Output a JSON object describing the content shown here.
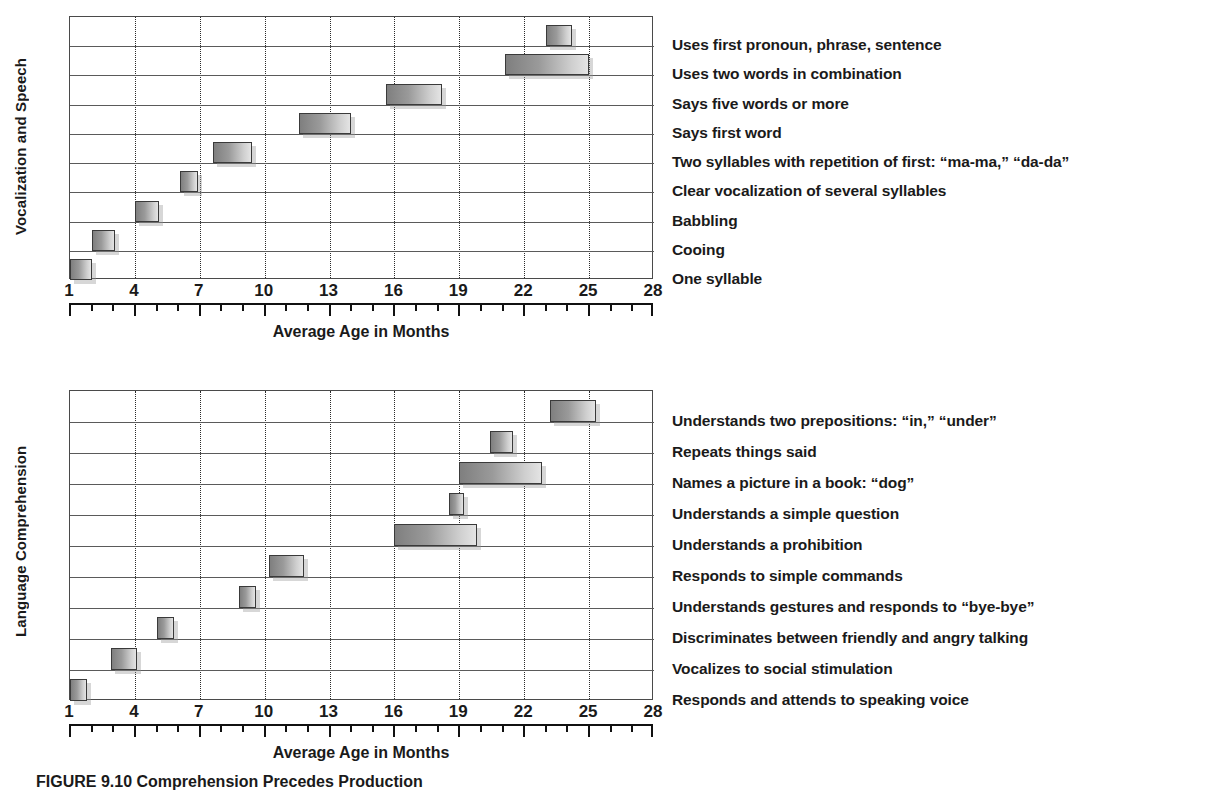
{
  "caption": "FIGURE 9.10  Comprehension Precedes Production",
  "axis": {
    "x_title": "Average Age in Months",
    "tick_labels": [
      "1",
      "4",
      "7",
      "10",
      "13",
      "16",
      "19",
      "22",
      "25",
      "28"
    ],
    "tick_values": [
      1,
      4,
      7,
      10,
      13,
      16,
      19,
      22,
      25,
      28
    ],
    "xlim": [
      1,
      28
    ]
  },
  "panels": [
    {
      "y_title": "Vocalization and Speech",
      "x_title": "Average Age in Months"
    },
    {
      "y_title": "Language Comprehension",
      "x_title": "Average Age in Months"
    }
  ],
  "chart_data": [
    {
      "type": "bar",
      "orientation": "horizontal",
      "title": "Vocalization and Speech",
      "subtitle": "",
      "xlabel": "Average Age in Months",
      "ylabel": "Vocalization and Speech",
      "xlim": [
        1,
        28
      ],
      "xticks": [
        1,
        4,
        7,
        10,
        13,
        16,
        19,
        22,
        25,
        28
      ],
      "grid": "vertical dotted gridlines at each major tick",
      "legend": "none",
      "note": "Each bar is a range (start-to-end age in months) drawn as a floating horizontal bar; rows are listed bottom-to-top in order of increasing age.",
      "categories": [
        "One syllable",
        "Cooing",
        "Babbling",
        "Clear vocalization of several syllables",
        "Two syllables with repetition of first: “ma-ma,” “da-da”",
        "Says first word",
        "Says five words or more",
        "Uses two words in combination",
        "Uses first pronoun, phrase, sentence"
      ],
      "ranges": [
        {
          "label": "One syllable",
          "start": 1.0,
          "end": 2.0
        },
        {
          "label": "Cooing",
          "start": 2.0,
          "end": 3.1
        },
        {
          "label": "Babbling",
          "start": 4.0,
          "end": 5.1
        },
        {
          "label": "Clear vocalization of several syllables",
          "start": 6.1,
          "end": 6.9
        },
        {
          "label": "Two syllables with repetition of first: “ma-ma,” “da-da”",
          "start": 7.6,
          "end": 9.4
        },
        {
          "label": "Says first word",
          "start": 11.6,
          "end": 14.0
        },
        {
          "label": "Says five words or more",
          "start": 15.6,
          "end": 18.2
        },
        {
          "label": "Uses two words in combination",
          "start": 21.1,
          "end": 25.0
        },
        {
          "label": "Uses first pronoun, phrase, sentence",
          "start": 23.0,
          "end": 24.2
        }
      ]
    },
    {
      "type": "bar",
      "orientation": "horizontal",
      "title": "Language Comprehension",
      "subtitle": "",
      "xlabel": "Average Age in Months",
      "ylabel": "Language Comprehension",
      "xlim": [
        1,
        28
      ],
      "xticks": [
        1,
        4,
        7,
        10,
        13,
        16,
        19,
        22,
        25,
        28
      ],
      "grid": "vertical dotted gridlines at each major tick",
      "legend": "none",
      "note": "Each bar is a range (start-to-end age in months) drawn as a floating horizontal bar; rows are listed bottom-to-top in order of increasing age.",
      "categories": [
        "Responds and attends to speaking voice",
        "Vocalizes to social stimulation",
        "Discriminates between friendly and angry talking",
        "Understands gestures and responds to “bye-bye”",
        "Responds to simple commands",
        "Understands a prohibition",
        "Understands a simple question",
        "Names a picture in a book: “dog”",
        "Repeats things said",
        "Understands two prepositions: “in,” “under”"
      ],
      "ranges": [
        {
          "label": "Responds and attends to speaking voice",
          "start": 1.0,
          "end": 1.8
        },
        {
          "label": "Vocalizes to social stimulation",
          "start": 2.9,
          "end": 4.1
        },
        {
          "label": "Discriminates between friendly and angry talking",
          "start": 5.0,
          "end": 5.8
        },
        {
          "label": "Understands gestures and responds to “bye-bye”",
          "start": 8.8,
          "end": 9.6
        },
        {
          "label": "Responds to simple commands",
          "start": 10.2,
          "end": 11.8
        },
        {
          "label": "Understands a prohibition",
          "start": 16.0,
          "end": 19.8
        },
        {
          "label": "Understands a simple question",
          "start": 18.5,
          "end": 19.2
        },
        {
          "label": "Names a picture in a book: “dog”",
          "start": 19.0,
          "end": 22.8
        },
        {
          "label": "Repeats things said",
          "start": 20.4,
          "end": 21.5
        },
        {
          "label": "Understands two prepositions: “in,” “under”",
          "start": 23.2,
          "end": 25.3
        }
      ]
    }
  ]
}
